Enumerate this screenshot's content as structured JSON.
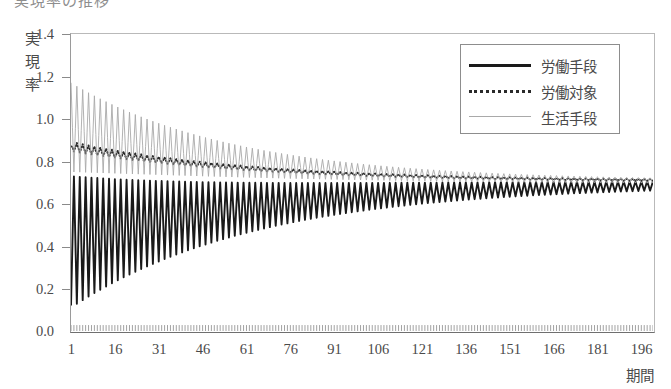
{
  "title_clipped": "実現率の推移",
  "axes": {
    "y_caption_chars": [
      "実",
      "現",
      "率"
    ],
    "x_caption": "期間",
    "y_ticks": [
      "1.4",
      "1.2",
      "1.0",
      "0.8",
      "0.6",
      "0.4",
      "0.2",
      "0.0"
    ],
    "x_ticks": [
      "1",
      "16",
      "31",
      "46",
      "61",
      "76",
      "91",
      "106",
      "121",
      "136",
      "151",
      "166",
      "181",
      "196"
    ]
  },
  "legend": {
    "items": [
      {
        "label": "労働手段",
        "style": "solid-thick",
        "color": "#1a1a1a"
      },
      {
        "label": "労働対象",
        "style": "dotted",
        "color": "#2a2a2a"
      },
      {
        "label": "生活手段",
        "style": "solid-thin",
        "color": "#a9a9a9"
      }
    ]
  },
  "chart_data": {
    "type": "line",
    "title": "実現率の推移",
    "xlabel": "期間",
    "ylabel": "実現率",
    "xlim": [
      1,
      200
    ],
    "ylim": [
      0.0,
      1.4
    ],
    "ytick_values": [
      0.0,
      0.2,
      0.4,
      0.6,
      0.8,
      1.0,
      1.2,
      1.4
    ],
    "xtick_values": [
      1,
      16,
      31,
      46,
      61,
      76,
      91,
      106,
      121,
      136,
      151,
      166,
      181,
      196
    ],
    "grid": false,
    "legend_position": "top-right",
    "series": [
      {
        "name": "労働手段",
        "style": "solid-thick",
        "color": "#1a1a1a",
        "model": {
          "kind": "damped_oscillation",
          "center_start": 0.42,
          "center_end": 0.7,
          "center_tau": 70,
          "amplitude_start": 0.31,
          "amplitude_end": 0.012,
          "amplitude_tau": 58,
          "period": 2,
          "phase_deg": 180,
          "start_value": 0.12
        }
      },
      {
        "name": "労働対象",
        "style": "dotted",
        "color": "#2a2a2a",
        "model": {
          "kind": "damped_oscillation",
          "center_start": 0.87,
          "center_end": 0.705,
          "center_tau": 62,
          "amplitude_start": 0.022,
          "amplitude_end": 0.004,
          "amplitude_tau": 55,
          "period": 2,
          "phase_deg": 0,
          "start_value": 0.87
        }
      },
      {
        "name": "生活手段",
        "style": "solid-thin",
        "color": "#a9a9a9",
        "model": {
          "kind": "damped_oscillation",
          "center_start": 0.96,
          "center_end": 0.7,
          "center_tau": 60,
          "amplitude_start": 0.21,
          "amplitude_end": 0.008,
          "amplitude_tau": 52,
          "period": 2,
          "phase_deg": 0,
          "start_value": 1.17
        }
      }
    ],
    "baseline_ticks": {
      "count": 200,
      "height": 0.028,
      "color": "#8a8a8a",
      "note": "dense minor tick comb drawn along the 0.0 baseline"
    }
  }
}
